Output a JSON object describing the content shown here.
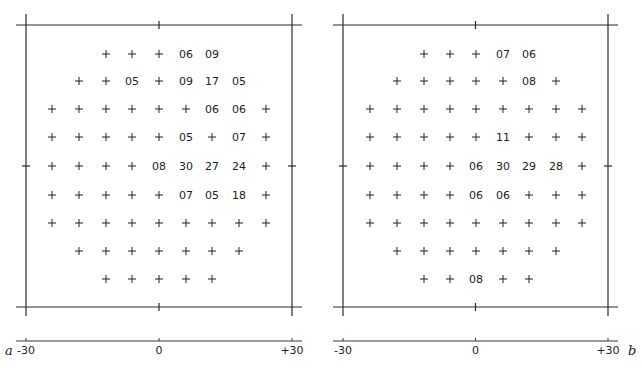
{
  "figure": {
    "panels": [
      {
        "letter": "a",
        "letter_position": "left",
        "axis": {
          "ticks": [
            "-30",
            "0",
            "+30"
          ]
        },
        "grid": {
          "rows": [
            {
              "start_col": 2,
              "cells": [
                "+",
                "+",
                "+",
                "06",
                "09"
              ]
            },
            {
              "start_col": 1,
              "cells": [
                "+",
                "+",
                "05",
                "+",
                "09",
                "17",
                "05"
              ]
            },
            {
              "start_col": 0,
              "cells": [
                "+",
                "+",
                "+",
                "+",
                "+",
                "+",
                "06",
                "06",
                "+"
              ]
            },
            {
              "start_col": 0,
              "cells": [
                "+",
                "+",
                "+",
                "+",
                "+",
                "05",
                "+",
                "07",
                "+"
              ]
            },
            {
              "start_col": 0,
              "cells": [
                "+",
                "+",
                "+",
                "+",
                "08",
                "30",
                "27",
                "24",
                "+"
              ]
            },
            {
              "start_col": 0,
              "cells": [
                "+",
                "+",
                "+",
                "+",
                "+",
                "07",
                "05",
                "18",
                "+"
              ]
            },
            {
              "start_col": 0,
              "cells": [
                "+",
                "+",
                "+",
                "+",
                "+",
                "+",
                "+",
                "+",
                "+"
              ]
            },
            {
              "start_col": 1,
              "cells": [
                "+",
                "+",
                "+",
                "+",
                "+",
                "+",
                "+"
              ]
            },
            {
              "start_col": 2,
              "cells": [
                "+",
                "+",
                "+",
                "+",
                "+"
              ]
            }
          ]
        }
      },
      {
        "letter": "b",
        "letter_position": "right",
        "axis": {
          "ticks": [
            "-30",
            "0",
            "+30"
          ]
        },
        "grid": {
          "rows": [
            {
              "start_col": 2,
              "cells": [
                "+",
                "+",
                "+",
                "07",
                "06"
              ]
            },
            {
              "start_col": 1,
              "cells": [
                "+",
                "+",
                "+",
                "+",
                "+",
                "08",
                "+"
              ]
            },
            {
              "start_col": 0,
              "cells": [
                "+",
                "+",
                "+",
                "+",
                "+",
                "+",
                "+",
                "+",
                "+"
              ]
            },
            {
              "start_col": 0,
              "cells": [
                "+",
                "+",
                "+",
                "+",
                "+",
                "11",
                "+",
                "+",
                "+"
              ]
            },
            {
              "start_col": 0,
              "cells": [
                "+",
                "+",
                "+",
                "+",
                "06",
                "30",
                "29",
                "28",
                "+"
              ]
            },
            {
              "start_col": 0,
              "cells": [
                "+",
                "+",
                "+",
                "+",
                "06",
                "06",
                "+",
                "+",
                "+"
              ]
            },
            {
              "start_col": 0,
              "cells": [
                "+",
                "+",
                "+",
                "+",
                "+",
                "+",
                "+",
                "+",
                "+"
              ]
            },
            {
              "start_col": 1,
              "cells": [
                "+",
                "+",
                "+",
                "+",
                "+",
                "+",
                "+"
              ]
            },
            {
              "start_col": 2,
              "cells": [
                "+",
                "+",
                "08",
                "+",
                "+"
              ]
            }
          ]
        }
      }
    ]
  }
}
